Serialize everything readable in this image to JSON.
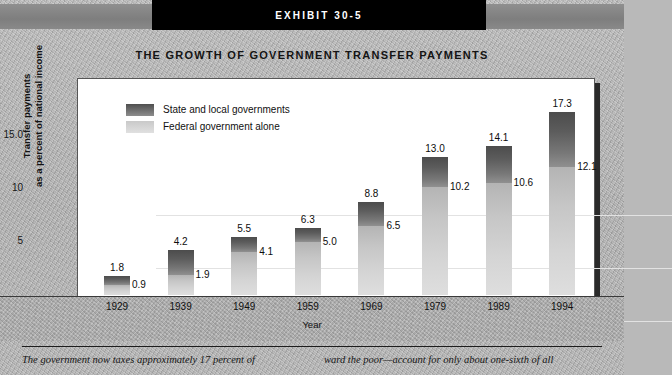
{
  "exhibit": {
    "banner_label": "EXHIBIT 30-5",
    "title": "THE GROWTH OF GOVERNMENT TRANSFER PAYMENTS"
  },
  "legend": {
    "items": [
      {
        "label": "State and local governments",
        "swatch": "dark-gray"
      },
      {
        "label": "Federal government alone",
        "swatch": "light-gray"
      }
    ]
  },
  "caption": {
    "column_left": "The government now taxes approximately 17 percent of",
    "column_right": "ward the poor—account for only about one-sixth of all"
  },
  "chart_data": {
    "type": "bar",
    "title": "THE GROWTH OF GOVERNMENT TRANSFER PAYMENTS",
    "xlabel": "Year",
    "ylabel": "Transfer payments as a percent of national income",
    "categories": [
      "1929",
      "1939",
      "1949",
      "1959",
      "1969",
      "1979",
      "1989",
      "1994"
    ],
    "ylim": [
      0,
      20
    ],
    "yticks": [
      "5",
      "10",
      "15.0"
    ],
    "ytick_values": [
      5,
      10,
      15
    ],
    "grid": true,
    "legend_position": "top-left inside plot",
    "stacked": true,
    "series": [
      {
        "name": "Total (state and local governments)",
        "values": [
          1.8,
          4.2,
          5.5,
          6.3,
          8.8,
          13.0,
          14.1,
          17.3
        ]
      },
      {
        "name": "Federal government alone",
        "values": [
          0.9,
          1.9,
          4.1,
          5.0,
          6.5,
          10.2,
          10.6,
          12.1
        ]
      }
    ],
    "bars": [
      {
        "year": "1929",
        "total": 1.8,
        "federal": 0.9,
        "total_label": "1.8",
        "federal_label": "0.9"
      },
      {
        "year": "1939",
        "total": 4.2,
        "federal": 1.9,
        "total_label": "4.2",
        "federal_label": "1.9"
      },
      {
        "year": "1949",
        "total": 5.5,
        "federal": 4.1,
        "total_label": "5.5",
        "federal_label": "4.1"
      },
      {
        "year": "1959",
        "total": 6.3,
        "federal": 5.0,
        "total_label": "6.3",
        "federal_label": "5.0"
      },
      {
        "year": "1969",
        "total": 8.8,
        "federal": 6.5,
        "total_label": "8.8",
        "federal_label": "6.5"
      },
      {
        "year": "1979",
        "total": 13.0,
        "federal": 10.2,
        "total_label": "13.0",
        "federal_label": "10.2"
      },
      {
        "year": "1989",
        "total": 14.1,
        "federal": 10.6,
        "total_label": "14.1",
        "federal_label": "10.6"
      },
      {
        "year": "1994",
        "total": 17.3,
        "federal": 12.1,
        "total_label": "17.3",
        "federal_label": "12.1"
      }
    ]
  },
  "colors": {
    "state_local": "#5c5c5c",
    "federal": "#d2d2d2",
    "banner_bg": "#000000",
    "page_bg": "#b4b4b4",
    "plot_bg": "#ffffff",
    "gridline": "#e2e2e2"
  }
}
